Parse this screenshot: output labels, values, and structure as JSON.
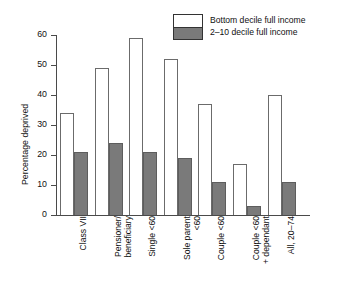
{
  "chart_data": {
    "type": "bar",
    "title": "",
    "subtitle": "",
    "xlabel": "",
    "ylabel": "Percentage deprived",
    "ylim": [
      0,
      60
    ],
    "yticks": [
      0,
      10,
      20,
      30,
      40,
      50,
      60
    ],
    "grid": false,
    "legend_position": "top-right",
    "categories": [
      "Class VII",
      "Pensioner/\nbeneficiary",
      "Single <60",
      "Sole parent\n<60",
      "Couple <60",
      "Couple <60\n+ dependant",
      "All, 20–74"
    ],
    "series": [
      {
        "name": "Bottom decile full income",
        "color": "#ffffff",
        "values": [
          34,
          49,
          59,
          52,
          37,
          17,
          40
        ]
      },
      {
        "name": "2–10 decile full income",
        "color": "#7a7a7a",
        "values": [
          21,
          24,
          21,
          19,
          11,
          3,
          11
        ]
      }
    ]
  },
  "legend": {
    "items": [
      {
        "label": "Bottom decile full income",
        "swatch": "white-box"
      },
      {
        "label": "2–10 decile full income",
        "swatch": "gray-box"
      }
    ]
  },
  "axes": {
    "y_title": "Percentage deprived",
    "y_tick_labels": [
      "60",
      "50",
      "40",
      "30",
      "20",
      "10",
      "0"
    ]
  }
}
